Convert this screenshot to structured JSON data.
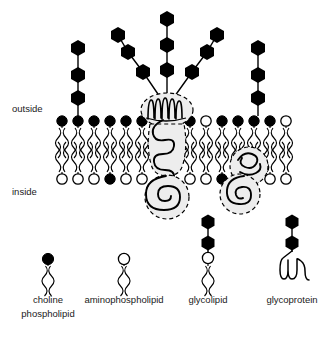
{
  "figure": {
    "background_color": "#ffffff",
    "ink_color": "#000000",
    "protein_fill_color": "#ededed",
    "width": 335,
    "height": 340
  },
  "labels": {
    "outside": "outside",
    "inside": "inside"
  },
  "membrane": {
    "outer_leaflet": {
      "name": "outer-leaflet",
      "head_count": 13,
      "heads": [
        {
          "x": 62,
          "type": "filled"
        },
        {
          "x": 78,
          "type": "filled"
        },
        {
          "x": 94,
          "type": "filled"
        },
        {
          "x": 110,
          "type": "filled"
        },
        {
          "x": 126,
          "type": "filled"
        },
        {
          "x": 142,
          "type": "filled"
        },
        {
          "x": 190,
          "type": "filled"
        },
        {
          "x": 206,
          "type": "open"
        },
        {
          "x": 222,
          "type": "filled"
        },
        {
          "x": 238,
          "type": "filled"
        },
        {
          "x": 254,
          "type": "filled"
        },
        {
          "x": 270,
          "type": "filled"
        },
        {
          "x": 286,
          "type": "open"
        }
      ]
    },
    "inner_leaflet": {
      "name": "inner-leaflet",
      "head_count": 13,
      "heads": [
        {
          "x": 62,
          "type": "open"
        },
        {
          "x": 78,
          "type": "open"
        },
        {
          "x": 94,
          "type": "open"
        },
        {
          "x": 110,
          "type": "filled"
        },
        {
          "x": 126,
          "type": "open"
        },
        {
          "x": 142,
          "type": "open"
        },
        {
          "x": 190,
          "type": "open"
        },
        {
          "x": 206,
          "type": "open"
        },
        {
          "x": 222,
          "type": "filled"
        },
        {
          "x": 238,
          "type": "open"
        },
        {
          "x": 254,
          "type": "open"
        },
        {
          "x": 270,
          "type": "open"
        },
        {
          "x": 286,
          "type": "open"
        }
      ]
    },
    "outer_head_y": 122,
    "inner_head_y": 178,
    "tail_length": 30
  },
  "glycans": {
    "left_glycolipid": {
      "name": "left-glycolipid-chain",
      "anchor_x": 78,
      "sugar_count": 3,
      "sugars": [
        {
          "x": 78,
          "y": 98
        },
        {
          "x": 78,
          "y": 75
        },
        {
          "x": 78,
          "y": 48
        }
      ]
    },
    "right_glycolipid": {
      "name": "right-glycolipid-chain",
      "anchor_x": 258,
      "sugar_count": 3,
      "sugars": [
        {
          "x": 258,
          "y": 98
        },
        {
          "x": 258,
          "y": 75
        },
        {
          "x": 258,
          "y": 48
        }
      ]
    },
    "glycoprotein_branches": [
      {
        "name": "glycan-branch-left",
        "sugar_count": 3,
        "sugars": [
          {
            "x": 143,
            "y": 72
          },
          {
            "x": 128,
            "y": 52
          },
          {
            "x": 118,
            "y": 35
          }
        ]
      },
      {
        "name": "glycan-branch-center",
        "sugar_count": 3,
        "sugars": [
          {
            "x": 167,
            "y": 70
          },
          {
            "x": 167,
            "y": 45
          },
          {
            "x": 167,
            "y": 19
          }
        ]
      },
      {
        "name": "glycan-branch-right",
        "sugar_count": 3,
        "sugars": [
          {
            "x": 192,
            "y": 72
          },
          {
            "x": 207,
            "y": 52
          },
          {
            "x": 217,
            "y": 35
          }
        ]
      }
    ]
  },
  "proteins": {
    "transmembrane_glycoprotein": {
      "name": "transmembrane-glycoprotein",
      "domains": [
        "extracellular-coil",
        "transmembrane-coil",
        "cytoplasmic-coil"
      ]
    },
    "peripheral_protein": {
      "name": "peripheral-membrane-protein",
      "domains": [
        "membrane-embedded-coil",
        "cytoplasmic-coil"
      ]
    }
  },
  "legend": {
    "items": [
      {
        "key": "choline-phospholipid",
        "label_line1": "choline",
        "label_line2": "phospholipid",
        "head_type": "filled",
        "sugar_count": 0,
        "cx": 48
      },
      {
        "key": "aminophospholipid",
        "label_line1": "aminophospholipid",
        "label_line2": "",
        "head_type": "open",
        "sugar_count": 0,
        "cx": 124
      },
      {
        "key": "glycolipid",
        "label_line1": "glycolipid",
        "label_line2": "",
        "head_type": "open",
        "sugar_count": 2,
        "cx": 208
      },
      {
        "key": "glycoprotein",
        "label_line1": "glycoprotein",
        "label_line2": "",
        "head_type": "multipass-protein",
        "sugar_count": 2,
        "cx": 292
      }
    ]
  }
}
